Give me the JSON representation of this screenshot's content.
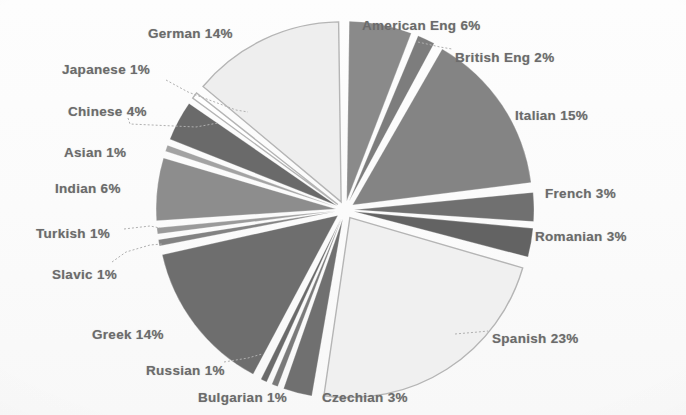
{
  "chart_data": {
    "type": "pie",
    "title": "",
    "units": "percent",
    "legend_position": "none",
    "label_format": "{name} {value}%",
    "start_angle_deg": 0,
    "direction": "clockwise",
    "exploded": true,
    "categories": [
      "American Eng",
      "British Eng",
      "Italian",
      "French",
      "Romanian",
      "Spanish",
      "Czechian",
      "Bulgarian",
      "Russian",
      "Greek",
      "Slavic",
      "Turkish",
      "Indian",
      "Asian",
      "Chinese",
      "Japanese",
      "German"
    ],
    "values": [
      6,
      2,
      15,
      3,
      3,
      23,
      3,
      1,
      1,
      14,
      1,
      1,
      6,
      1,
      4,
      1,
      14
    ],
    "slices": [
      {
        "name": "American Eng",
        "value": 6,
        "label": "American Eng 6%",
        "color": "#8a8a8a"
      },
      {
        "name": "British Eng",
        "value": 2,
        "label": "British Eng 2%",
        "color": "#7d7d7d"
      },
      {
        "name": "Italian",
        "value": 15,
        "label": "Italian 15%",
        "color": "#848484"
      },
      {
        "name": "French",
        "value": 3,
        "label": "French 3%",
        "color": "#6f6f6f"
      },
      {
        "name": "Romanian",
        "value": 3,
        "label": "Romanian 3%",
        "color": "#646464"
      },
      {
        "name": "Spanish",
        "value": 23,
        "label": "Spanish 23%",
        "color": "#f0f0f0"
      },
      {
        "name": "Czechian",
        "value": 3,
        "label": "Czechian 3%",
        "color": "#707070"
      },
      {
        "name": "Bulgarian",
        "value": 1,
        "label": "Bulgarian 1%",
        "color": "#7a7a7a"
      },
      {
        "name": "Russian",
        "value": 1,
        "label": "Russian 1%",
        "color": "#6a6a6a"
      },
      {
        "name": "Greek",
        "value": 14,
        "label": "Greek 14%",
        "color": "#6e6e6e"
      },
      {
        "name": "Slavic",
        "value": 1,
        "label": "Slavic 1%",
        "color": "#828282"
      },
      {
        "name": "Turkish",
        "value": 1,
        "label": "Turkish 1%",
        "color": "#9a9a9a"
      },
      {
        "name": "Indian",
        "value": 6,
        "label": "Indian 6%",
        "color": "#8d8d8d"
      },
      {
        "name": "Asian",
        "value": 1,
        "label": "Asian 1%",
        "color": "#a3a3a3"
      },
      {
        "name": "Chinese",
        "value": 4,
        "label": "Chinese 4%",
        "color": "#6b6b6b"
      },
      {
        "name": "Japanese",
        "value": 1,
        "label": "Japanese 1%",
        "color": "#ffffff"
      },
      {
        "name": "German",
        "value": 14,
        "label": "German 14%",
        "color": "#eeeeee"
      }
    ]
  },
  "labels": [
    {
      "key": "german",
      "text": "German 14%",
      "x": 148,
      "y": 26,
      "align": "left"
    },
    {
      "key": "japanese",
      "text": "Japanese 1%",
      "x": 62,
      "y": 62,
      "align": "left"
    },
    {
      "key": "chinese",
      "text": "Chinese 4%",
      "x": 68,
      "y": 104,
      "align": "left"
    },
    {
      "key": "asian",
      "text": "Asian 1%",
      "x": 64,
      "y": 145,
      "align": "left"
    },
    {
      "key": "indian",
      "text": "Indian 6%",
      "x": 55,
      "y": 181,
      "align": "left"
    },
    {
      "key": "turkish",
      "text": "Turkish 1%",
      "x": 36,
      "y": 226,
      "align": "left"
    },
    {
      "key": "slavic",
      "text": "Slavic 1%",
      "x": 52,
      "y": 267,
      "align": "left"
    },
    {
      "key": "greek",
      "text": "Greek 14%",
      "x": 92,
      "y": 327,
      "align": "left"
    },
    {
      "key": "russian",
      "text": "Russian 1%",
      "x": 146,
      "y": 363,
      "align": "left"
    },
    {
      "key": "bulgarian",
      "text": "Bulgarian 1%",
      "x": 198,
      "y": 390,
      "align": "left"
    },
    {
      "key": "czechian",
      "text": "Czechian 3%",
      "x": 322,
      "y": 390,
      "align": "left"
    },
    {
      "key": "spanish",
      "text": "Spanish 23%",
      "x": 492,
      "y": 331,
      "align": "left"
    },
    {
      "key": "romanian",
      "text": "Romanian 3%",
      "x": 535,
      "y": 229,
      "align": "left"
    },
    {
      "key": "french",
      "text": "French 3%",
      "x": 545,
      "y": 186,
      "align": "left"
    },
    {
      "key": "italian",
      "text": "Italian 15%",
      "x": 515,
      "y": 108,
      "align": "left"
    },
    {
      "key": "british_eng",
      "text": "British Eng 2%",
      "x": 455,
      "y": 50,
      "align": "left"
    },
    {
      "key": "american_eng",
      "text": "American Eng 6%",
      "x": 362,
      "y": 18,
      "align": "left"
    }
  ],
  "geometry": {
    "center_x": 345,
    "center_y": 210,
    "radius": 180,
    "explode_offset": 9,
    "gap_deg": 1.6
  },
  "leaders": [
    {
      "key": "japanese-leader",
      "points": "166,80 188,92 236,110 248,112"
    },
    {
      "key": "chinese-leader",
      "points": "128,118 130,124 196,127 218,123"
    },
    {
      "key": "turkish-leader",
      "points": "124,229 150,226 160,228"
    },
    {
      "key": "slavic-leader",
      "points": "112,262 126,252 150,245 162,244"
    },
    {
      "key": "russian-leader",
      "points": "224,362 248,358 262,354"
    },
    {
      "key": "spanish-leader",
      "points": "455,334 478,332 488,331"
    },
    {
      "key": "british-leader",
      "points": "418,42 440,47 452,49"
    }
  ]
}
